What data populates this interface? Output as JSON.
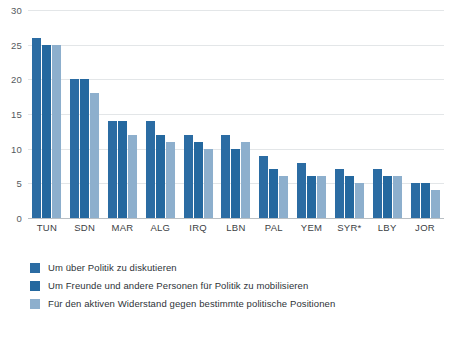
{
  "chart_data": {
    "type": "bar",
    "title": "",
    "subtitle": "",
    "xlabel": "",
    "ylabel": "",
    "ylim": [
      0,
      30
    ],
    "y_ticks": [
      0,
      5,
      10,
      15,
      20,
      25,
      30
    ],
    "grid": true,
    "legend_position": "bottom-left",
    "categories": [
      "TUN",
      "SDN",
      "MAR",
      "ALG",
      "IRQ",
      "LBN",
      "PAL",
      "YEM",
      "SYR*",
      "LBY",
      "JOR"
    ],
    "series": [
      {
        "name": "Um über Politik zu diskutieren",
        "color": "#2b6ca3",
        "values": [
          26,
          20,
          14,
          14,
          12,
          12,
          9,
          8,
          7,
          7,
          5
        ]
      },
      {
        "name": "Um Freunde und andere Personen für Politik zu mobilisieren",
        "color": "#24689f",
        "values": [
          25,
          20,
          14,
          12,
          11,
          10,
          7,
          6,
          6,
          6,
          5
        ]
      },
      {
        "name": "Für den aktiven Widerstand gegen bestimmte politische Positionen",
        "color": "#8dafcd",
        "values": [
          25,
          18,
          12,
          11,
          10,
          11,
          6,
          6,
          5,
          6,
          4
        ]
      }
    ]
  },
  "colors": {
    "series_1": "#2b6ca3",
    "series_2": "#24689f",
    "series_3": "#8dafcd",
    "gridline": "#e3e6e8",
    "baseline": "#b9bfc4",
    "tick_text": "#555a5e",
    "label_text": "#3c4145",
    "legend_text": "#2e3338",
    "background": "#ffffff"
  }
}
